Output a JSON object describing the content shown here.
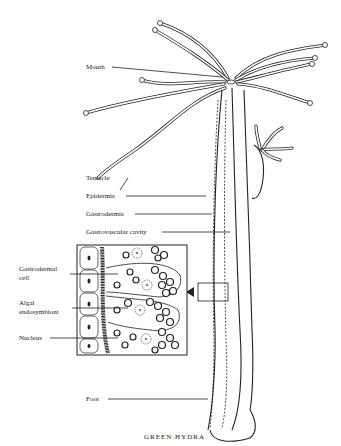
{
  "diagram": {
    "title": "GREEN HYDRA",
    "labels": {
      "mouth": "Mouth",
      "tentacle": "Tentacle",
      "epidermis": "Epidermis",
      "gastrodermis": "Gastrodermis",
      "gastrovascular_cavity": "Gastrovascular cavity",
      "gastrodermal_cell_line1": "Gastrodermal",
      "gastrodermal_cell_line2": "cell",
      "algal_endosymbiont_line1": "Algal",
      "algal_endosymbiont_line2": "endosymbiont",
      "nucleus": "Nucleus",
      "foot": "Foot"
    },
    "inset": {
      "description": "magnified cross-section of body wall",
      "pointer": "arrow-left"
    }
  }
}
